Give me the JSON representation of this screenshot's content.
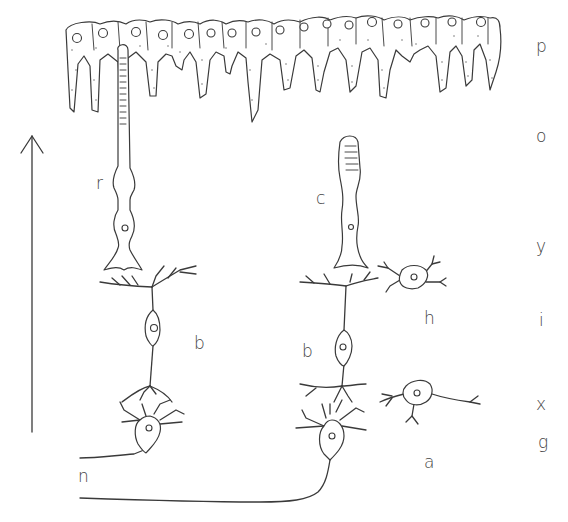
{
  "diagram": {
    "direction_arrow": "up",
    "cell_labels": {
      "rod": "r",
      "cone": "c",
      "bipolar_left": "b",
      "bipolar_right": "b",
      "horizontal": "h",
      "amacrine": "a",
      "nerve_fiber": "n"
    },
    "layer_labels": [
      {
        "id": "p",
        "text": "p",
        "y": 48
      },
      {
        "id": "o",
        "text": "o",
        "y": 138
      },
      {
        "id": "y",
        "text": "y",
        "y": 248
      },
      {
        "id": "i",
        "text": "i",
        "y": 320
      },
      {
        "id": "x",
        "text": "x",
        "y": 405
      },
      {
        "id": "g",
        "text": "g",
        "y": 445
      }
    ],
    "colors": {
      "line": "#3a3a3a",
      "text": "#444444",
      "background": "#ffffff"
    }
  }
}
